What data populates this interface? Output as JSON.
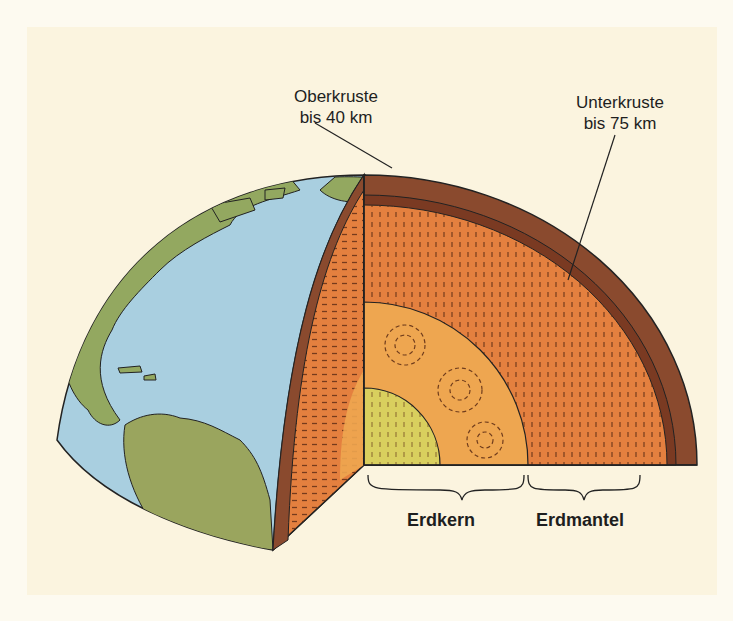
{
  "diagram": {
    "labels": {
      "upper_crust": {
        "name": "Oberkruste",
        "depth": "bis 40 km"
      },
      "lower_crust": {
        "name": "Unterkruste",
        "depth": "bis 75 km"
      },
      "core": "Erdkern",
      "mantle": "Erdmantel"
    },
    "colors": {
      "background": "#fbf4df",
      "ocean": "#a9cfe0",
      "land": "#93a860",
      "crust": "#8a4a2e",
      "mantle": "#e4803f",
      "outer_core": "#eea650",
      "inner_core": "#d9cf5e"
    }
  }
}
